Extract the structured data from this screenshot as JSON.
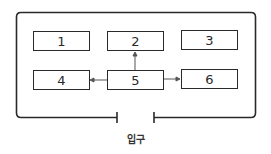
{
  "diagram": {
    "rooms": [
      {
        "id": "1",
        "label": "1"
      },
      {
        "id": "2",
        "label": "2"
      },
      {
        "id": "3",
        "label": "3"
      },
      {
        "id": "4",
        "label": "4"
      },
      {
        "id": "5",
        "label": "5"
      },
      {
        "id": "6",
        "label": "6"
      }
    ],
    "arrows": [
      {
        "from": "5",
        "to": "2"
      },
      {
        "from": "5",
        "to": "4"
      },
      {
        "from": "5",
        "to": "6"
      }
    ],
    "entrance_label": "입구",
    "line_color": "#2a2a2a"
  }
}
